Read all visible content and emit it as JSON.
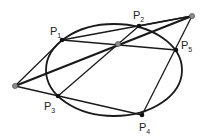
{
  "diagram": {
    "ellipse": {
      "cx": 114,
      "cy": 70,
      "rx": 68,
      "ry": 46
    },
    "points": {
      "P1": {
        "x": 62,
        "y": 40
      },
      "P2": {
        "x": 139,
        "y": 26
      },
      "P3": {
        "x": 58,
        "y": 96
      },
      "P4": {
        "x": 142,
        "y": 115
      },
      "P5": {
        "x": 176,
        "y": 50
      },
      "L": {
        "x": 15,
        "y": 86
      },
      "C": {
        "x": 118,
        "y": 44
      },
      "R": {
        "x": 192,
        "y": 16
      }
    },
    "labels": [
      {
        "name": "P",
        "sub": "1"
      },
      {
        "name": "P",
        "sub": "2"
      },
      {
        "name": "P",
        "sub": "3"
      },
      {
        "name": "P",
        "sub": "4"
      },
      {
        "name": "P",
        "sub": "5"
      }
    ],
    "colors": {
      "line": "#1a1a1a",
      "gray_point": "#8a8a8a"
    }
  }
}
